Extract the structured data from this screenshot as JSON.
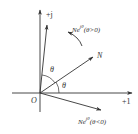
{
  "diagram": {
    "type": "complex-plane-rotation",
    "colors": {
      "stroke": "#333333",
      "text": "#333333",
      "background": "#ffffff"
    },
    "axes": {
      "imaginary_label": "+j",
      "real_label": "+1",
      "origin_label": "O"
    },
    "vectors": [
      {
        "name": "N",
        "label": "N"
      },
      {
        "name": "rotated-positive",
        "label_base": "Ne",
        "label_sup": "jθ",
        "label_cond": "(θ>0)"
      },
      {
        "name": "rotated-negative",
        "label_base": "Ne",
        "label_sup": "jθ",
        "label_cond": "(θ<0)"
      }
    ],
    "angle_labels": [
      "θ",
      "θ"
    ]
  }
}
